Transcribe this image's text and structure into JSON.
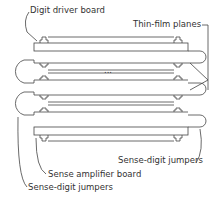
{
  "diagram": {
    "labels": {
      "digit_driver_board": "Digit driver board",
      "thin_film_planes": "Thin-film planes",
      "sense_digit_jumpers_right": "Sense-digit jumpers",
      "sense_amplifier_board": "Sense amplifier board",
      "sense_digit_jumpers_left": "Sense-digit jumpers"
    },
    "ellipsis": "..."
  }
}
